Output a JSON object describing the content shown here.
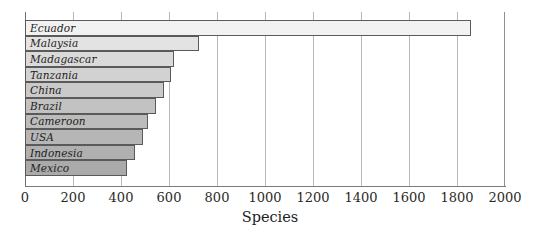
{
  "chart_data": {
    "type": "bar",
    "orientation": "horizontal",
    "title": "",
    "xlabel": "Species",
    "ylabel": "",
    "xlim": [
      0,
      2000
    ],
    "xticks": [
      0,
      200,
      400,
      600,
      800,
      1000,
      1200,
      1400,
      1600,
      1800,
      2000
    ],
    "grid": true,
    "legend": "none",
    "categories": [
      "Ecuador",
      "Malaysia",
      "Madagascar",
      "Tanzania",
      "China",
      "Brazil",
      "Cameroon",
      "USA",
      "Indonesia",
      "Mexico"
    ],
    "values": [
      1860,
      725,
      620,
      610,
      580,
      545,
      512,
      490,
      458,
      425
    ],
    "bar_colors": [
      "#f2f2f2",
      "#e3e3e3",
      "#dadada",
      "#d2d2d2",
      "#cacaca",
      "#c2c2c2",
      "#bcbcbc",
      "#b6b6b6",
      "#b0b0b0",
      "#aaaaaa"
    ],
    "bar_border_color": "#5a5a5a",
    "gridline_color": "#b9b9b9",
    "axis_color": "#7a7a7a"
  }
}
